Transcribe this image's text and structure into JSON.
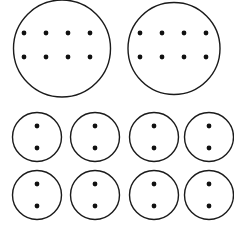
{
  "figure": {
    "width": 234,
    "height": 227,
    "background_color": "#ffffff",
    "stroke_color": "#1a1a1a",
    "dot_color": "#111111",
    "circle_stroke_width": 1.4,
    "dot_radius": 2.4
  },
  "groups": [
    {
      "name": "large-circle-1",
      "size": "large",
      "cx": 62,
      "cy": 48.5,
      "r": 48.5,
      "dot_count": 8,
      "dot_rows": 2,
      "dot_cols": 4,
      "dots": [
        {
          "x": 24,
          "y": 33
        },
        {
          "x": 46,
          "y": 33
        },
        {
          "x": 68,
          "y": 33
        },
        {
          "x": 90,
          "y": 33
        },
        {
          "x": 24,
          "y": 57
        },
        {
          "x": 46,
          "y": 57
        },
        {
          "x": 68,
          "y": 57
        },
        {
          "x": 90,
          "y": 57
        }
      ]
    },
    {
      "name": "large-circle-2",
      "size": "large",
      "cx": 174,
      "cy": 48.5,
      "r": 46,
      "dot_count": 8,
      "dot_rows": 2,
      "dot_cols": 4,
      "dots": [
        {
          "x": 140,
          "y": 33
        },
        {
          "x": 162,
          "y": 33
        },
        {
          "x": 184,
          "y": 33
        },
        {
          "x": 206,
          "y": 33
        },
        {
          "x": 140,
          "y": 57
        },
        {
          "x": 162,
          "y": 57
        },
        {
          "x": 184,
          "y": 57
        },
        {
          "x": 206,
          "y": 57
        }
      ]
    },
    {
      "name": "small-circle-1",
      "size": "small",
      "cx": 37,
      "cy": 137,
      "r": 24.5,
      "dot_count": 2,
      "dot_rows": 2,
      "dot_cols": 1,
      "dots": [
        {
          "x": 37,
          "y": 126
        },
        {
          "x": 37,
          "y": 148
        }
      ]
    },
    {
      "name": "small-circle-2",
      "size": "small",
      "cx": 95,
      "cy": 137,
      "r": 24.5,
      "dot_count": 2,
      "dot_rows": 2,
      "dot_cols": 1,
      "dots": [
        {
          "x": 95,
          "y": 126
        },
        {
          "x": 95,
          "y": 148
        }
      ]
    },
    {
      "name": "small-circle-3",
      "size": "small",
      "cx": 154,
      "cy": 137,
      "r": 24.5,
      "dot_count": 2,
      "dot_rows": 2,
      "dot_cols": 1,
      "dots": [
        {
          "x": 154,
          "y": 126
        },
        {
          "x": 154,
          "y": 148
        }
      ]
    },
    {
      "name": "small-circle-4",
      "size": "small",
      "cx": 209,
      "cy": 137,
      "r": 24.5,
      "dot_count": 2,
      "dot_rows": 2,
      "dot_cols": 1,
      "dots": [
        {
          "x": 209,
          "y": 126
        },
        {
          "x": 209,
          "y": 148
        }
      ]
    },
    {
      "name": "small-circle-5",
      "size": "small",
      "cx": 37,
      "cy": 195,
      "r": 24.5,
      "dot_count": 2,
      "dot_rows": 2,
      "dot_cols": 1,
      "dots": [
        {
          "x": 37,
          "y": 184
        },
        {
          "x": 37,
          "y": 206
        }
      ]
    },
    {
      "name": "small-circle-6",
      "size": "small",
      "cx": 95,
      "cy": 195,
      "r": 24.5,
      "dot_count": 2,
      "dot_rows": 2,
      "dot_cols": 1,
      "dots": [
        {
          "x": 95,
          "y": 184
        },
        {
          "x": 95,
          "y": 206
        }
      ]
    },
    {
      "name": "small-circle-7",
      "size": "small",
      "cx": 154,
      "cy": 195,
      "r": 24.5,
      "dot_count": 2,
      "dot_rows": 2,
      "dot_cols": 1,
      "dots": [
        {
          "x": 154,
          "y": 184
        },
        {
          "x": 154,
          "y": 206
        }
      ]
    },
    {
      "name": "small-circle-8",
      "size": "small",
      "cx": 209,
      "cy": 195,
      "r": 24.5,
      "dot_count": 2,
      "dot_rows": 2,
      "dot_cols": 1,
      "dots": [
        {
          "x": 209,
          "y": 184
        },
        {
          "x": 209,
          "y": 206
        }
      ]
    }
  ],
  "summary": {
    "total_circles": 10,
    "large_circles": 2,
    "small_circles": 8,
    "dots_per_large_circle": 8,
    "dots_per_small_circle": 2,
    "total_dots": 32
  }
}
